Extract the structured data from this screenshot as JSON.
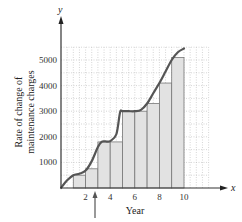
{
  "chart_data": {
    "type": "bar",
    "subtype": "riemann-sum-with-curve",
    "title": "",
    "xlabel": "Year",
    "ylabel": "Rate of change of maintenance charges",
    "x_axis_symbol": "x",
    "y_axis_symbol": "y",
    "xlim": [
      0,
      12
    ],
    "ylim": [
      0,
      5500
    ],
    "x_ticks": [
      2,
      4,
      6,
      8,
      10
    ],
    "x_tick_labels": [
      "2",
      "4",
      "6",
      "8",
      "10"
    ],
    "y_ticks": [
      1000,
      2000,
      3000,
      4000,
      5000
    ],
    "y_tick_labels": [
      "1000",
      "2000",
      "3000",
      "4000",
      "5000"
    ],
    "grid": true,
    "grid_style": "dotted",
    "grid_x_step": 0.5,
    "grid_y_step": 500,
    "legend": "none",
    "bars": {
      "width": 1,
      "left_edges": [
        1,
        2,
        3,
        4,
        5,
        6,
        7,
        8,
        9
      ],
      "heights": [
        500,
        750,
        1800,
        1800,
        3000,
        3000,
        3300,
        4100,
        5100
      ],
      "fill": "#e2e2e2",
      "stroke": "#777777"
    },
    "curve": {
      "x": [
        0,
        0.5,
        1,
        1.5,
        2,
        2.5,
        3,
        3.3,
        3.6,
        4,
        4.5,
        4.8,
        5,
        5.5,
        6,
        6.5,
        7,
        7.5,
        8,
        8.5,
        9,
        9.5,
        10
      ],
      "y": [
        0,
        300,
        500,
        560,
        680,
        1050,
        1600,
        1800,
        1820,
        1830,
        2100,
        2950,
        3000,
        3000,
        3000,
        3050,
        3300,
        3700,
        4100,
        4550,
        5000,
        5300,
        5450
      ],
      "stroke": "#555555"
    },
    "annotations": [
      {
        "type": "arrow",
        "x": 2.7,
        "direction": "up",
        "label": ""
      }
    ]
  },
  "labels": {
    "y_axis_line1": "Rate of change of",
    "y_axis_line2": "maintenance charges",
    "x_axis": "Year",
    "x_sym": "x",
    "y_sym": "y",
    "xticks": [
      "2",
      "4",
      "6",
      "8",
      "10"
    ],
    "yticks": [
      "1000",
      "2000",
      "3000",
      "4000",
      "5000"
    ]
  }
}
